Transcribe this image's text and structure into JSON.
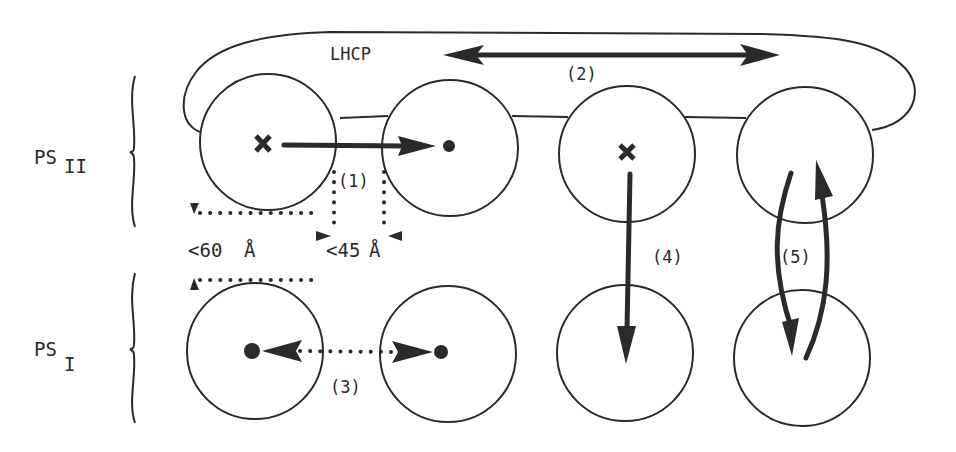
{
  "diagram": {
    "groups": [
      {
        "label_main": "PS",
        "label_sub": "II"
      },
      {
        "label_main": "PS",
        "label_sub": "I"
      }
    ],
    "antenna_label": "LHCP",
    "process_labels": [
      "(1)",
      "(2)",
      "(3)",
      "(4)",
      "(5)"
    ],
    "distances": {
      "vertical": "<60 Å",
      "vertical_prefix": "<60",
      "vertical_unit": "Å",
      "horizontal": "<45Å",
      "horizontal_prefix": "<45",
      "horizontal_unit": "Å"
    },
    "markers": {
      "closed_center": "×",
      "open_center": "•"
    },
    "colors": {
      "ink": "#2a2a2a",
      "background": "#ffffff"
    }
  }
}
